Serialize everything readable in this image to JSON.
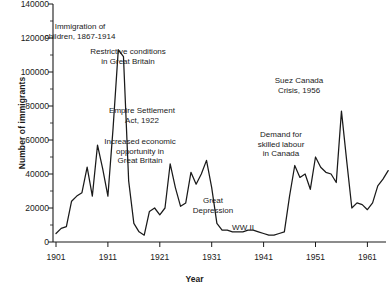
{
  "chart_data": {
    "type": "line",
    "title": "",
    "xlabel": "Year",
    "ylabel": "Number of immigrants",
    "xlim": [
      1901,
      1965
    ],
    "ylim": [
      0,
      140000
    ],
    "grid": false,
    "legend": null,
    "xticks": [
      "1901",
      "1911",
      "1921",
      "1931",
      "1941",
      "1951",
      "1961"
    ],
    "xtick_values": [
      1901,
      1911,
      1921,
      1931,
      1941,
      1951,
      1961
    ],
    "yticks": [
      "0",
      "20000",
      "40000",
      "60000",
      "80000",
      "100000",
      "120000",
      "140000"
    ],
    "ytick_values": [
      0,
      20000,
      40000,
      60000,
      80000,
      100000,
      120000,
      140000
    ],
    "series_name": "Number of immigrants",
    "line_color": "#1a1a1a",
    "x": [
      1901,
      1902,
      1903,
      1904,
      1905,
      1906,
      1907,
      1908,
      1909,
      1910,
      1911,
      1912,
      1913,
      1914,
      1915,
      1916,
      1917,
      1918,
      1919,
      1920,
      1921,
      1922,
      1923,
      1924,
      1925,
      1926,
      1927,
      1928,
      1929,
      1930,
      1931,
      1932,
      1933,
      1934,
      1935,
      1936,
      1937,
      1938,
      1939,
      1940,
      1941,
      1942,
      1943,
      1944,
      1945,
      1946,
      1947,
      1948,
      1949,
      1950,
      1951,
      1952,
      1953,
      1954,
      1955,
      1956,
      1957,
      1958,
      1959,
      1960,
      1961,
      1962,
      1963,
      1964,
      1965
    ],
    "values": [
      5000,
      8000,
      9000,
      24000,
      27000,
      29000,
      44000,
      27000,
      57000,
      43000,
      27000,
      67000,
      113000,
      109000,
      36000,
      11000,
      6000,
      4000,
      18000,
      20000,
      16000,
      20000,
      46000,
      32000,
      21000,
      23000,
      41000,
      34000,
      40000,
      48000,
      32000,
      11000,
      7000,
      7000,
      6000,
      6000,
      6000,
      7000,
      7000,
      6000,
      5000,
      4000,
      4000,
      5000,
      6000,
      27000,
      45000,
      38000,
      40000,
      31000,
      50000,
      44000,
      41000,
      40000,
      35000,
      77000,
      48000,
      20000,
      23000,
      22000,
      19000,
      23000,
      33000,
      37000,
      42000
    ],
    "annotations": [
      {
        "id": "immigration-children",
        "text": "Immigration of\nchildren, 1867-1914",
        "x": 80,
        "y": 22
      },
      {
        "id": "restrictive-conditions",
        "text": "Restrictive conditions\nin Great Britain",
        "x": 128,
        "y": 47
      },
      {
        "id": "empire-settlement",
        "text": "Empire Settlement\nAct, 1922",
        "x": 142,
        "y": 106
      },
      {
        "id": "increased-economic",
        "text": "Increased economic\nopportunity in\nGreat Britain",
        "x": 140,
        "y": 137
      },
      {
        "id": "great-depression",
        "text": "Great\nDepression",
        "x": 213,
        "y": 196
      },
      {
        "id": "ww2",
        "text": "WW II",
        "x": 243,
        "y": 223
      },
      {
        "id": "suez-crisis",
        "text": "Suez Canada\nCrisis, 1956",
        "x": 299,
        "y": 76
      },
      {
        "id": "demand-skilled-labour",
        "text": "Demand for\nskilled labour\nin Canada",
        "x": 281,
        "y": 130
      }
    ]
  }
}
